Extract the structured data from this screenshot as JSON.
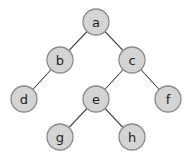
{
  "diagram": {
    "type": "binary-tree",
    "colors": {
      "node_fill": "#d4d4d4",
      "node_stroke": "#8a8a8a",
      "edge": "#4a4a4a",
      "background": "#ffffff"
    },
    "nodes": [
      {
        "id": "a",
        "label": "a",
        "x": 96,
        "y": 22
      },
      {
        "id": "b",
        "label": "b",
        "x": 60,
        "y": 60
      },
      {
        "id": "c",
        "label": "c",
        "x": 132,
        "y": 60
      },
      {
        "id": "d",
        "label": "d",
        "x": 24,
        "y": 99
      },
      {
        "id": "e",
        "label": "e",
        "x": 96,
        "y": 99
      },
      {
        "id": "f",
        "label": "f",
        "x": 168,
        "y": 99
      },
      {
        "id": "g",
        "label": "g",
        "x": 60,
        "y": 137
      },
      {
        "id": "h",
        "label": "h",
        "x": 132,
        "y": 137
      }
    ],
    "edges": [
      {
        "from": "a",
        "to": "b"
      },
      {
        "from": "a",
        "to": "c"
      },
      {
        "from": "b",
        "to": "d"
      },
      {
        "from": "c",
        "to": "e"
      },
      {
        "from": "c",
        "to": "f"
      },
      {
        "from": "e",
        "to": "g"
      },
      {
        "from": "e",
        "to": "h"
      }
    ]
  }
}
